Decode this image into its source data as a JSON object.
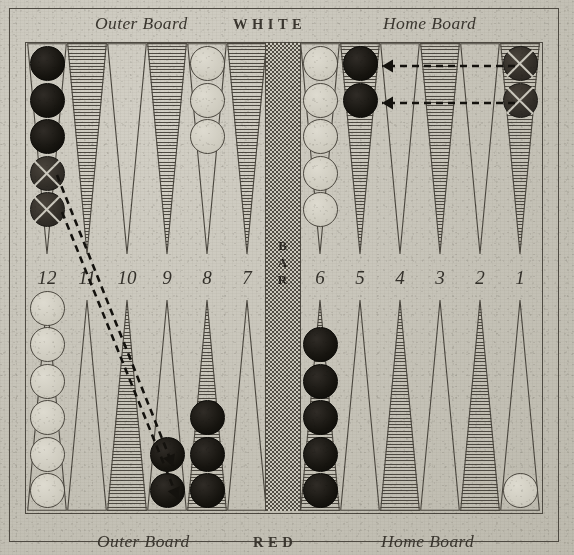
{
  "diagram": {
    "labels": {
      "top_left": "Outer Board",
      "top_center": "WHITE",
      "top_right": "Home Board",
      "bottom_left": "Outer Board",
      "bottom_center": "RED",
      "bottom_right": "Home Board",
      "bar": "BAR"
    },
    "point_numbers": [
      "12",
      "11",
      "10",
      "9",
      "8",
      "7",
      "6",
      "5",
      "4",
      "3",
      "2",
      "1"
    ],
    "colors": {
      "paper": "#c9c6bb",
      "ink": "#3a362f",
      "black_checker": "#16140f",
      "white_checker": "#cdcabe",
      "marked_checker": "#322e28",
      "point_hatch": "#4e4a42"
    },
    "top_points": [
      {
        "number": "12",
        "shaded": false,
        "checkers": [
          "black",
          "black",
          "black",
          "cross",
          "cross"
        ]
      },
      {
        "number": "11",
        "shaded": true,
        "checkers": []
      },
      {
        "number": "10",
        "shaded": false,
        "checkers": []
      },
      {
        "number": "9",
        "shaded": true,
        "checkers": []
      },
      {
        "number": "8",
        "shaded": false,
        "checkers": [
          "white",
          "white",
          "white"
        ]
      },
      {
        "number": "7",
        "shaded": true,
        "checkers": []
      },
      {
        "number": "6",
        "shaded": false,
        "checkers": [
          "white",
          "white",
          "white",
          "white",
          "white"
        ]
      },
      {
        "number": "5",
        "shaded": true,
        "checkers": [
          "black",
          "black"
        ]
      },
      {
        "number": "4",
        "shaded": false,
        "checkers": []
      },
      {
        "number": "3",
        "shaded": true,
        "checkers": []
      },
      {
        "number": "2",
        "shaded": false,
        "checkers": []
      },
      {
        "number": "1",
        "shaded": true,
        "checkers": [
          "cross",
          "cross"
        ]
      }
    ],
    "bottom_points": [
      {
        "number": "12",
        "shaded": false,
        "checkers": [
          "white",
          "white",
          "white",
          "white",
          "white",
          "white"
        ]
      },
      {
        "number": "11",
        "shaded": false,
        "checkers": []
      },
      {
        "number": "10",
        "shaded": true,
        "checkers": []
      },
      {
        "number": "9",
        "shaded": false,
        "checkers": [
          "black",
          "black"
        ]
      },
      {
        "number": "8",
        "shaded": true,
        "checkers": [
          "black",
          "black",
          "black"
        ]
      },
      {
        "number": "7",
        "shaded": false,
        "checkers": []
      },
      {
        "number": "6",
        "shaded": true,
        "checkers": [
          "black",
          "black",
          "black",
          "black",
          "black"
        ]
      },
      {
        "number": "5",
        "shaded": false,
        "checkers": []
      },
      {
        "number": "4",
        "shaded": true,
        "checkers": []
      },
      {
        "number": "3",
        "shaded": false,
        "checkers": []
      },
      {
        "number": "2",
        "shaded": true,
        "checkers": []
      },
      {
        "number": "1",
        "shaded": false,
        "checkers": [
          "white"
        ]
      }
    ],
    "moves": [
      {
        "id": "move-1",
        "from": "top-1",
        "to": "top-5",
        "style": "dashed-horizontal",
        "x1": 515,
        "y1": 66,
        "x2": 382,
        "y2": 66
      },
      {
        "id": "move-2",
        "from": "top-1",
        "to": "top-5",
        "style": "dashed-horizontal",
        "x1": 515,
        "y1": 103,
        "x2": 382,
        "y2": 103
      },
      {
        "id": "move-3",
        "from": "top-12",
        "to": "bottom-9",
        "style": "dashed-diagonal",
        "x1": 57,
        "y1": 175,
        "x2": 173,
        "y2": 466
      },
      {
        "id": "move-4",
        "from": "top-12",
        "to": "bottom-9",
        "style": "dashed-diagonal",
        "x1": 62,
        "y1": 212,
        "x2": 178,
        "y2": 499
      }
    ]
  }
}
